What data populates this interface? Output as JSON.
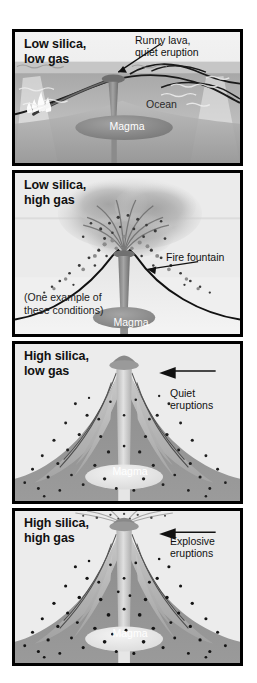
{
  "figure": {
    "kind": "volcanic-eruption-style-diagram",
    "panels": [
      {
        "id": "low-silica-low-gas",
        "title": "Low silica,\nlow gas",
        "callout": "Runny lava,\nquiet eruption",
        "labels": [
          "Ocean",
          "Magma"
        ],
        "magma_label": "Magma",
        "ocean_label": "Ocean"
      },
      {
        "id": "low-silica-high-gas",
        "title": "Low silica,\nhigh gas",
        "callout": "Fire fountain",
        "note": "(One example of\nthese conditions)",
        "magma_label": "Magma"
      },
      {
        "id": "high-silica-low-gas",
        "title": "High silica,\nlow gas",
        "callout": "Quiet\neruptions",
        "magma_label": "Magma"
      },
      {
        "id": "high-silica-high-gas",
        "title": "High silica,\nhigh gas",
        "callout": "Explosive\neruptions",
        "magma_label": "Magma"
      }
    ]
  },
  "colors": {
    "background": "#ffffff",
    "panel_border": "#000000",
    "sky": "#ebebeb",
    "ocean_water": "#9a9a9a",
    "magma_conduit": "#8e8e8e",
    "magma_body": "#8a8a8a",
    "magma_body_light": "#e3e3e3",
    "ash_cloud": "#b4b4b4",
    "cone_fill": "#f0f0f0",
    "cone_dark": "#8a8a8a",
    "text_dark": "#111111",
    "text_light": "#ffffff"
  }
}
